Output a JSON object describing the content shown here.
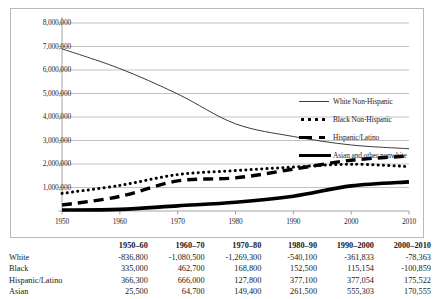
{
  "chart_data": {
    "type": "line",
    "title": "",
    "subtitle": "",
    "xlabel": "",
    "ylabel": "",
    "x": [
      1950,
      1960,
      1970,
      1980,
      1990,
      2000,
      2010
    ],
    "xlim": [
      1950,
      2010
    ],
    "ylim": [
      0,
      8000000
    ],
    "grid": true,
    "legend_position": "right",
    "y_ticks": [
      "-",
      "1,000,000",
      "2,000,000",
      "3,000,000",
      "4,000,000",
      "5,000,000",
      "6,000,000",
      "7,000,000",
      "8,000,000"
    ],
    "y_tick_values": [
      0,
      1000000,
      2000000,
      3000000,
      4000000,
      5000000,
      6000000,
      7000000,
      8000000
    ],
    "x_ticks": [
      "1950",
      "1960",
      "1970",
      "1980",
      "1990",
      "2000",
      "2010"
    ],
    "series": [
      {
        "name": "White Non-Hispanic",
        "style": "thin-solid",
        "color": "#3b3b3b",
        "values": [
          6900000,
          6060000,
          4980000,
          3710000,
          3170000,
          2810000,
          2650000
        ]
      },
      {
        "name": "Black Non-Hispanic",
        "style": "dotted",
        "color": "#000000",
        "values": [
          750000,
          1090000,
          1550000,
          1720000,
          1870000,
          1990000,
          1890000
        ]
      },
      {
        "name": "Hispanic/Latino",
        "style": "dashed",
        "color": "#000000",
        "values": [
          250000,
          620000,
          1280000,
          1410000,
          1780000,
          2160000,
          2340000
        ]
      },
      {
        "name": "Asian and other nonwhite",
        "style": "thick-solid",
        "color": "#000000",
        "values": [
          40000,
          70000,
          220000,
          370000,
          630000,
          1070000,
          1240000
        ]
      }
    ]
  },
  "legend": {
    "items": [
      {
        "label": "White Non-Hispanic",
        "key": "thin-solid-key"
      },
      {
        "label": "Black Non-Hispanic",
        "key": "dotted-key"
      },
      {
        "label": "Hispanic/Latino",
        "key": "dashed-key"
      },
      {
        "label": "Asian and other nonwhite",
        "key": "thick-solid-key"
      }
    ]
  },
  "table": {
    "corner_header": "",
    "columns": [
      "1950–60",
      "1960–70",
      "1970–80",
      "1980–90",
      "1990–2000",
      "2000–2010"
    ],
    "rows": [
      {
        "label": "White",
        "values": [
          "-836,800",
          "-1,080,500",
          "-1,269,300",
          "-540,100",
          "-361,833",
          "-78,363"
        ]
      },
      {
        "label": "Black",
        "values": [
          "335,000",
          "462,700",
          "168,800",
          "152,500",
          "115,154",
          "-100,859"
        ]
      },
      {
        "label": "Hispanic/Latino",
        "values": [
          "366,300",
          "666,000",
          "127,800",
          "377,100",
          "377,054",
          "175,522"
        ]
      },
      {
        "label": "Asian",
        "values": [
          "25,500",
          "64,700",
          "149,400",
          "261,500",
          "555,303",
          "170,555"
        ]
      }
    ]
  }
}
